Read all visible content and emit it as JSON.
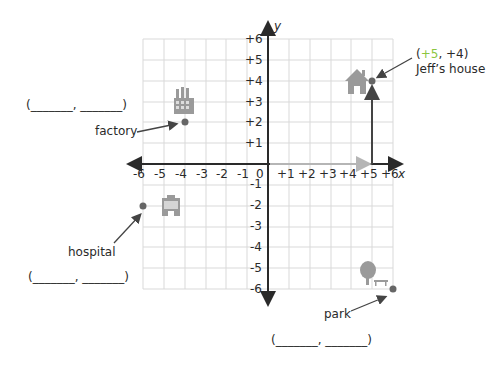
{
  "grid": {
    "x_range": [
      -6,
      6
    ],
    "y_range": [
      -6,
      6
    ],
    "x_axis_label": "x",
    "y_axis_label": "y",
    "x_ticks": [
      "-6",
      "-5",
      "-4",
      "-3",
      "-2",
      "-1",
      "+1",
      "+2",
      "+3",
      "+4",
      "+5",
      "+6"
    ],
    "y_ticks": [
      "+6",
      "+5",
      "+4",
      "+3",
      "+2",
      "+1",
      "-1",
      "-2",
      "-3",
      "-4",
      "-5",
      "-6"
    ],
    "origin_label": "0"
  },
  "locations": [
    {
      "name": "Jeff's house",
      "label": "Jeff’s house",
      "x": 5,
      "y": 4,
      "coord_text_open": "(",
      "coord_x": "+5",
      "coord_sep": ", ",
      "coord_y": "+4",
      "coord_text_close": ")",
      "icon": "house-icon"
    },
    {
      "name": "factory",
      "label": "factory",
      "x": -4,
      "y": 2,
      "answer_blank": "(_______, _______)",
      "icon": "factory-icon"
    },
    {
      "name": "hospital",
      "label": "hospital",
      "x": -6,
      "y": -2,
      "answer_blank": "(_______, _______)",
      "icon": "hospital-icon"
    },
    {
      "name": "park",
      "label": "park",
      "x": 6,
      "y": -6,
      "answer_blank": "(_______, _______)",
      "icon": "park-icon"
    }
  ],
  "path": {
    "description": "Path from origin right 5 units then up 4 units to Jeff's house",
    "horizontal_color": "#b5b5b5",
    "vertical_color": "#444444"
  },
  "colors": {
    "grid": "#d9d9d9",
    "axis": "#2a2a2a",
    "point": "#666666",
    "icon": "#9a9a9a",
    "highlight": "#8cc63f"
  }
}
